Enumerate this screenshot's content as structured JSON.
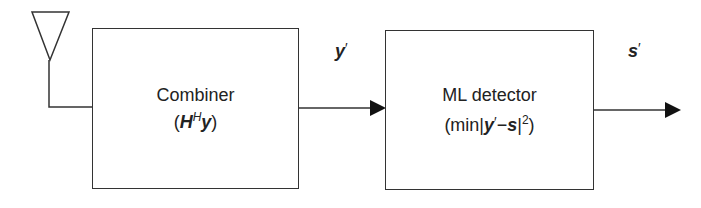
{
  "diagram": {
    "antenna": {
      "label": ""
    },
    "blocks": [
      {
        "name": "Combiner",
        "formula_parts": [
          "(",
          "H",
          "H",
          "y",
          ")"
        ]
      },
      {
        "name": "ML detector",
        "formula_parts": [
          "(min|",
          "y",
          "′",
          "−",
          "s",
          "|",
          "2",
          ")"
        ]
      }
    ],
    "signals": [
      {
        "from": "Combiner",
        "to": "ML detector",
        "symbol": "y",
        "prime": "′"
      },
      {
        "from": "ML detector",
        "to": "output",
        "symbol": "s",
        "prime": "′"
      }
    ],
    "colors": {
      "line": "#333333",
      "text": "#222222",
      "background": "#ffffff"
    }
  }
}
